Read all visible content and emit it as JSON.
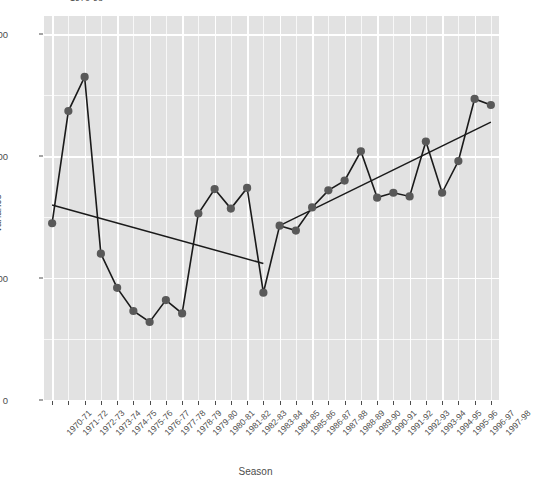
{
  "chart_data": {
    "type": "line",
    "title": "1970-98",
    "xlabel": "Season",
    "ylabel": "Variance",
    "ylim": [
      0,
      315
    ],
    "yticks": [
      0,
      100,
      200,
      300
    ],
    "ytick_labels": [
      "0",
      "100",
      "200",
      "300"
    ],
    "grid": true,
    "legend": "none",
    "marker": "filled-circle",
    "point_color": "#595959",
    "line_color": "#1a1a1a",
    "panel_color": "#e2e2e2",
    "grid_color": "#ffffff",
    "categories": [
      "1970-71",
      "1971-72",
      "1972-73",
      "1973-74",
      "1974-75",
      "1975-76",
      "1976-77",
      "1977-78",
      "1978-79",
      "1979-80",
      "1980-81",
      "1981-82",
      "1982-83",
      "1983-84",
      "1984-85",
      "1985-86",
      "1986-87",
      "1987-88",
      "1988-89",
      "1989-90",
      "1990-91",
      "1991-92",
      "1992-93",
      "1993-94",
      "1994-95",
      "1995-96",
      "1996-97",
      "1997-98"
    ],
    "series": [
      {
        "name": "Variance",
        "values": [
          145,
          237,
          265,
          120,
          92,
          73,
          64,
          82,
          71,
          153,
          173,
          157,
          174,
          88,
          143,
          139,
          158,
          172,
          180,
          204,
          166,
          170,
          167,
          212,
          170,
          196,
          247,
          242
        ]
      }
    ],
    "trend_lines": [
      {
        "name": "trend-1970-1984",
        "x_start_category": "1970-71",
        "x_end_category": "1983-84",
        "y_start": 160,
        "y_end": 112
      },
      {
        "name": "trend-1984-1998",
        "x_start_category": "1984-85",
        "x_end_category": "1997-98",
        "y_start": 143,
        "y_end": 228
      }
    ]
  }
}
